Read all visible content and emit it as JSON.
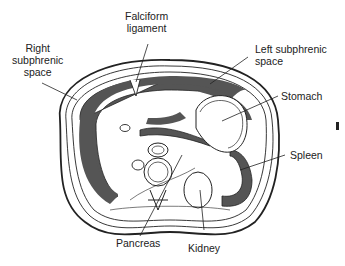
{
  "labels": {
    "falciform": [
      "Falciform",
      "ligament"
    ],
    "right_subphrenic": [
      "Right",
      "subphrenic",
      "space"
    ],
    "left_subphrenic": [
      "Left subphrenic",
      "space"
    ],
    "stomach": "Stomach",
    "spleen": "Spleen",
    "pancreas": "Pancreas",
    "kidney": "Kidney"
  },
  "colors": {
    "line": "#222222",
    "shade": "#555555",
    "background": "#ffffff"
  }
}
